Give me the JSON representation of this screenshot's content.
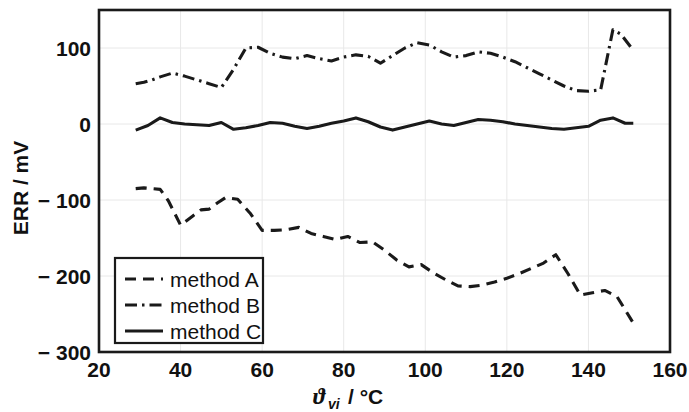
{
  "chart_data": {
    "type": "line",
    "title": "",
    "xlabel": "ϑvi / °C",
    "xlabel_parts": {
      "symbol": "ϑ",
      "subscript": "vi",
      "unit": "/ °C"
    },
    "ylabel": "ERR / mV",
    "xlim": [
      20,
      160
    ],
    "ylim": [
      -300,
      150
    ],
    "xticks": [
      20,
      40,
      60,
      80,
      100,
      120,
      140,
      160
    ],
    "yticks": [
      100,
      0,
      -100,
      -200,
      -300
    ],
    "ytick_labels": [
      "100",
      "0",
      "− 100",
      "− 200",
      "− 300"
    ],
    "grid": true,
    "grid_color": "#e8e8e8",
    "axis_color": "#1a1a1a",
    "legend_position": "lower left",
    "series": [
      {
        "name": "method A",
        "style": "dashed",
        "color": "#1a1a1a",
        "x": [
          29,
          31,
          33,
          35,
          37,
          40,
          43,
          45,
          47,
          49,
          51,
          54,
          57,
          60,
          63,
          66,
          69,
          72,
          75,
          78,
          81,
          84,
          87,
          90,
          93,
          96,
          99,
          102,
          105,
          108,
          111,
          114,
          117,
          120,
          123,
          126,
          129,
          132,
          135,
          138,
          141,
          144,
          147,
          151
        ],
        "values": [
          -85,
          -84,
          -85,
          -86,
          -101,
          -133,
          -121,
          -113,
          -112,
          -104,
          -97,
          -99,
          -117,
          -140,
          -140,
          -139,
          -136,
          -144,
          -148,
          -152,
          -148,
          -156,
          -155,
          -166,
          -179,
          -188,
          -185,
          -196,
          -205,
          -213,
          -214,
          -212,
          -208,
          -203,
          -197,
          -190,
          -183,
          -172,
          -197,
          -225,
          -222,
          -219,
          -227,
          -262
        ]
      },
      {
        "name": "method B",
        "style": "dashdot",
        "color": "#1a1a1a",
        "x": [
          29,
          31,
          33,
          35,
          38,
          41,
          44,
          47,
          50,
          53,
          56,
          59,
          62,
          65,
          68,
          71,
          74,
          77,
          80,
          83,
          86,
          89,
          92,
          95,
          98,
          101,
          104,
          107,
          110,
          113,
          116,
          119,
          122,
          125,
          128,
          131,
          134,
          137,
          140,
          143,
          146,
          148,
          151
        ],
        "values": [
          53,
          55,
          58,
          62,
          67,
          63,
          58,
          53,
          48,
          72,
          100,
          101,
          93,
          88,
          86,
          90,
          86,
          83,
          88,
          91,
          89,
          80,
          90,
          100,
          107,
          104,
          95,
          88,
          90,
          95,
          93,
          88,
          82,
          74,
          66,
          58,
          50,
          44,
          43,
          45,
          124,
          118,
          97
        ]
      },
      {
        "name": "method C",
        "style": "solid",
        "color": "#1a1a1a",
        "x": [
          29,
          32,
          35,
          38,
          41,
          44,
          47,
          50,
          53,
          56,
          59,
          62,
          65,
          68,
          71,
          74,
          77,
          80,
          83,
          86,
          89,
          92,
          95,
          98,
          101,
          104,
          107,
          110,
          113,
          116,
          119,
          122,
          125,
          128,
          131,
          134,
          137,
          140,
          143,
          146,
          149,
          151
        ],
        "values": [
          -8,
          -2,
          8,
          2,
          0,
          -1,
          -2,
          2,
          -7,
          -5,
          -2,
          2,
          1,
          -3,
          -6,
          -3,
          1,
          4,
          8,
          3,
          -4,
          -8,
          -4,
          0,
          4,
          0,
          -2,
          2,
          6,
          5,
          3,
          0,
          -2,
          -4,
          -6,
          -7,
          -5,
          -3,
          5,
          8,
          1,
          1
        ]
      }
    ]
  },
  "legend": {
    "items": [
      {
        "label": "method A",
        "style": "dashed"
      },
      {
        "label": "method B",
        "style": "dashdot"
      },
      {
        "label": "method C",
        "style": "solid"
      }
    ]
  }
}
